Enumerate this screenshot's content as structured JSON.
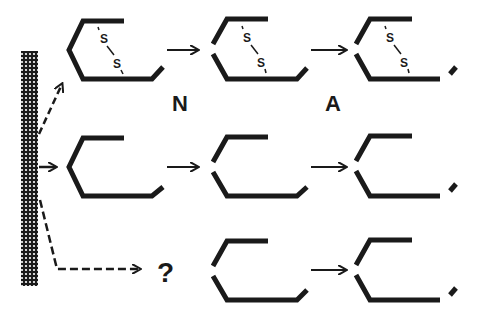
{
  "diagram": {
    "type": "protein processing / maturation scheme",
    "stroke_color": "#1a1a1a",
    "background": "#ffffff",
    "source": {
      "name": "membrane-column",
      "pattern": "dotted"
    },
    "labels": {
      "step1": "N",
      "step2": "A",
      "unknown": "?",
      "disulfide_atom": "S"
    },
    "rows": [
      {
        "name": "row-with-disulfide",
        "entry_arrow": "dashed",
        "has_disulfide": true,
        "stages": [
          "intact",
          "cleaved-left",
          "cleaved-left-and-tail"
        ]
      },
      {
        "name": "row-without-disulfide",
        "entry_arrow": "solid",
        "has_disulfide": false,
        "stages": [
          "intact",
          "cleaved-left",
          "cleaved-left-and-tail"
        ]
      },
      {
        "name": "row-unknown-origin",
        "entry_arrow": "dashed",
        "has_disulfide": false,
        "stages": [
          "unknown",
          "cleaved-left",
          "cleaved-left-and-tail"
        ]
      }
    ]
  }
}
